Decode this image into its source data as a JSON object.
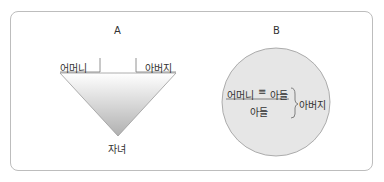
{
  "diagram": {
    "panel_a": {
      "title": "A",
      "left_label": "어머니",
      "right_label": "아버지",
      "bottom_label": "자녀"
    },
    "panel_b": {
      "title": "B",
      "numerator_left": "어머니",
      "symbol": "≡",
      "numerator_right": "아들",
      "denominator": "아들",
      "bracket_label": "아버지"
    },
    "colors": {
      "border": "#bdbdbd",
      "circle_fill": "#e6e6e6",
      "circle_stroke": "#9a9a9a",
      "triangle_top": "#ffffff",
      "triangle_bottom": "#b5b5b5"
    }
  }
}
